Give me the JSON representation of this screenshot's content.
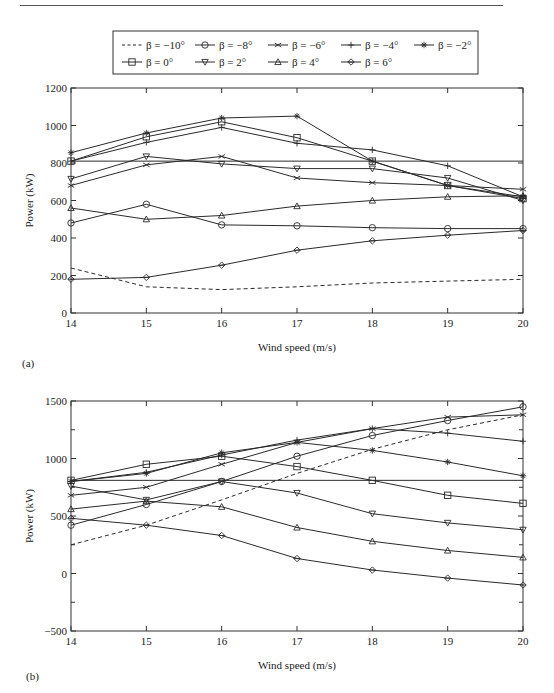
{
  "legend": {
    "entries": [
      {
        "label": "β = −10°",
        "marker": "none",
        "dash": true
      },
      {
        "label": "β = −8°",
        "marker": "circle"
      },
      {
        "label": "β = −6°",
        "marker": "x"
      },
      {
        "label": "β = −4°",
        "marker": "plus"
      },
      {
        "label": "β = −2°",
        "marker": "star"
      },
      {
        "label": "β = 0°",
        "marker": "square"
      },
      {
        "label": "β = 2°",
        "marker": "triangle-down"
      },
      {
        "label": "β = 4°",
        "marker": "triangle-up"
      },
      {
        "label": "β = 6°",
        "marker": "diamond"
      }
    ]
  },
  "panels": {
    "a": {
      "label": "(a)"
    },
    "b": {
      "label": "(b)"
    }
  },
  "chart_data": [
    {
      "type": "line",
      "panel": "(a)",
      "title": "",
      "xlabel": "Wind speed (m/s)",
      "ylabel": "Power (kW)",
      "x": [
        14,
        15,
        16,
        17,
        18,
        19,
        20
      ],
      "xlim": [
        14,
        20
      ],
      "ylim": [
        0,
        1200
      ],
      "yticks": [
        0,
        200,
        400,
        600,
        800,
        1000,
        1200
      ],
      "xticks": [
        14,
        15,
        16,
        17,
        18,
        19,
        20
      ],
      "grid": false,
      "legend_position": "top, outside",
      "reference_line": {
        "y": 810,
        "style": "solid"
      },
      "series": [
        {
          "name": "β = −10°",
          "marker": "none",
          "dash": true,
          "values": [
            240,
            140,
            125,
            140,
            160,
            170,
            180
          ]
        },
        {
          "name": "β = −8°",
          "marker": "circle",
          "values": [
            480,
            580,
            470,
            465,
            455,
            450,
            450
          ]
        },
        {
          "name": "β = −6°",
          "marker": "x",
          "values": [
            680,
            790,
            835,
            720,
            695,
            680,
            660
          ]
        },
        {
          "name": "β = −4°",
          "marker": "plus",
          "values": [
            810,
            910,
            990,
            905,
            870,
            785,
            620
          ]
        },
        {
          "name": "β = −2°",
          "marker": "star",
          "values": [
            855,
            960,
            1040,
            1050,
            810,
            680,
            620
          ]
        },
        {
          "name": "β = 0°",
          "marker": "square",
          "values": [
            810,
            940,
            1020,
            935,
            810,
            680,
            610
          ]
        },
        {
          "name": "β = 2°",
          "marker": "triangle-down",
          "values": [
            715,
            835,
            795,
            770,
            770,
            720,
            600
          ]
        },
        {
          "name": "β = 4°",
          "marker": "triangle-up",
          "values": [
            560,
            500,
            520,
            570,
            600,
            620,
            625
          ]
        },
        {
          "name": "β = 6°",
          "marker": "diamond",
          "values": [
            180,
            190,
            255,
            335,
            385,
            415,
            440
          ]
        }
      ]
    },
    {
      "type": "line",
      "panel": "(b)",
      "title": "",
      "xlabel": "Wind speed (m/s)",
      "ylabel": "Power (kW)",
      "x": [
        14,
        15,
        16,
        17,
        18,
        19,
        20
      ],
      "xlim": [
        14,
        20
      ],
      "ylim": [
        -500,
        1500
      ],
      "yticks": [
        -500,
        0,
        500,
        1000,
        1500
      ],
      "xticks": [
        14,
        15,
        16,
        17,
        18,
        19,
        20
      ],
      "grid": false,
      "reference_line": {
        "y": 810,
        "style": "solid"
      },
      "series": [
        {
          "name": "β = −10°",
          "marker": "none",
          "dash": true,
          "values": [
            250,
            420,
            640,
            870,
            1080,
            1250,
            1380
          ]
        },
        {
          "name": "β = −8°",
          "marker": "circle",
          "values": [
            420,
            600,
            800,
            1020,
            1200,
            1330,
            1450
          ]
        },
        {
          "name": "β = −6°",
          "marker": "x",
          "values": [
            680,
            750,
            950,
            1140,
            1260,
            1360,
            1380
          ]
        },
        {
          "name": "β = −4°",
          "marker": "plus",
          "values": [
            800,
            880,
            1030,
            1160,
            1260,
            1220,
            1150
          ]
        },
        {
          "name": "β = −2°",
          "marker": "star",
          "values": [
            800,
            870,
            1050,
            1140,
            1070,
            970,
            850
          ]
        },
        {
          "name": "β = 0°",
          "marker": "square",
          "values": [
            810,
            950,
            1020,
            930,
            810,
            680,
            610
          ]
        },
        {
          "name": "β = 2°",
          "marker": "triangle-down",
          "values": [
            760,
            640,
            800,
            700,
            520,
            440,
            380
          ]
        },
        {
          "name": "β = 4°",
          "marker": "triangle-up",
          "values": [
            560,
            630,
            580,
            400,
            280,
            200,
            140
          ]
        },
        {
          "name": "β = 6°",
          "marker": "diamond",
          "values": [
            480,
            420,
            330,
            130,
            30,
            -40,
            -100
          ]
        }
      ]
    }
  ]
}
